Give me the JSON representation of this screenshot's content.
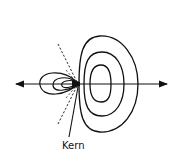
{
  "diagram": {
    "type": "orbital-contour-plot",
    "labels": {
      "nucleus": "Kern"
    },
    "colors": {
      "stroke": "#111111",
      "background": "#ffffff"
    },
    "axis": {
      "orientation": "horizontal",
      "arrows": "both-ends"
    },
    "lobes": {
      "large_right_contours": 3,
      "small_left_contours": 3
    },
    "nodal_lines": 2
  }
}
